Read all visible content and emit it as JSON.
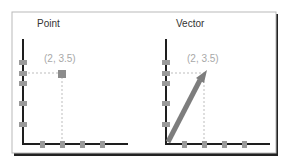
{
  "panels": [
    {
      "title": "Point",
      "coord_label": "(2, 3.5)",
      "kind": "point"
    },
    {
      "title": "Vector",
      "coord_label": "(2, 3.5)",
      "kind": "vector"
    }
  ],
  "colors": {
    "border": "#b9b9b9",
    "shadow": "#222222",
    "axis": "#1e1e1e",
    "tick": "#9a9a9a",
    "marker": "#8c8c8c",
    "guide": "#bdbdbd",
    "label": "#a8a8a8",
    "title": "#333333"
  }
}
